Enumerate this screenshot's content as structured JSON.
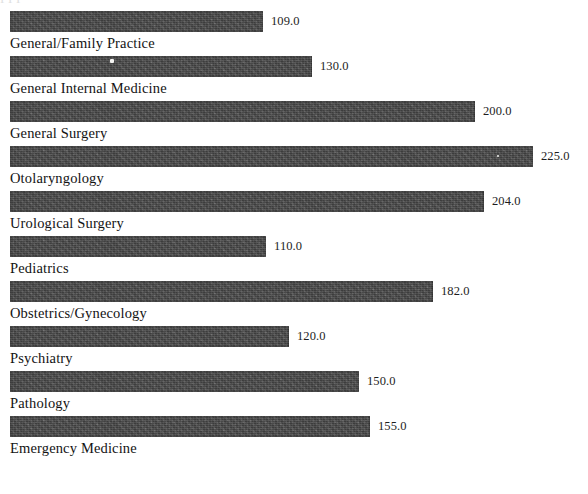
{
  "document": {
    "top_cut_text": "I I I"
  },
  "chart_data": {
    "type": "bar",
    "orientation": "horizontal",
    "title": "",
    "subtitle": "",
    "xlabel": "",
    "ylabel": "",
    "grid": false,
    "legend": null,
    "value_label_format": "one-decimal",
    "xlim": [
      0,
      225
    ],
    "bar_color": "#474747",
    "text_color": "#131313",
    "categories": [
      "General/Family Practice",
      "General Internal Medicine",
      "General Surgery",
      "Otolaryngology",
      "Urological Surgery",
      "Pediatrics",
      "Obstetrics/Gynecology",
      "Psychiatry",
      "Pathology",
      "Emergency Medicine"
    ],
    "values": [
      109.0,
      130.0,
      200.0,
      225.0,
      204.0,
      110.0,
      182.0,
      120.0,
      150.0,
      155.0
    ],
    "value_labels": [
      "109.0",
      "130.0",
      "200.0",
      "225.0",
      "204.0",
      "110.0",
      "182.0",
      "120.0",
      "150.0",
      "155.0"
    ]
  }
}
